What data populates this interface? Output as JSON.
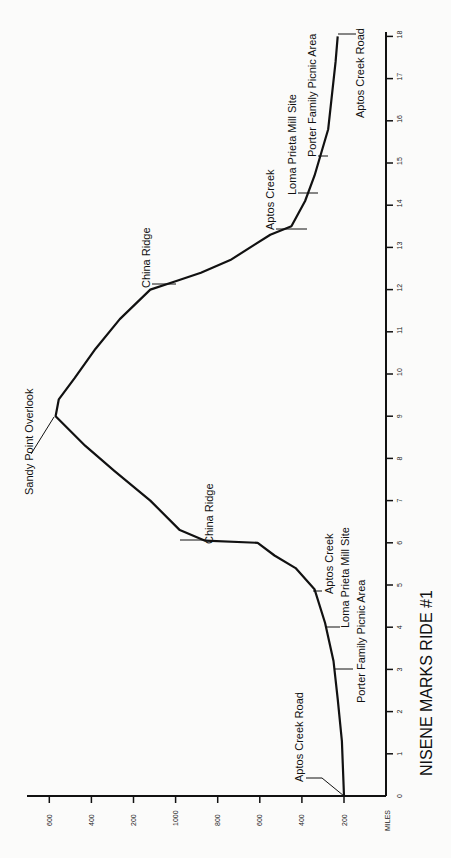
{
  "chart_data": {
    "type": "line",
    "title": "NISENE MARKS RIDE #1",
    "xlabel": "MILES",
    "ylabel": "",
    "orientation": "rotated-90",
    "xlim": [
      0,
      18
    ],
    "ylim": [
      200,
      1600
    ],
    "grid": false,
    "x_ticks": [
      "0",
      "1",
      "2",
      "3",
      "4",
      "5",
      "6",
      "7",
      "8",
      "9",
      "10",
      "11",
      "12",
      "13",
      "14",
      "15",
      "16",
      "17",
      "18"
    ],
    "y_ticks": [
      {
        "value": 1600,
        "label": "600"
      },
      {
        "value": 1400,
        "label": "400"
      },
      {
        "value": 1200,
        "label": "200"
      },
      {
        "value": 1000,
        "label": "1000"
      },
      {
        "value": 800,
        "label": "800"
      },
      {
        "value": 600,
        "label": "600"
      },
      {
        "value": 400,
        "label": "400"
      },
      {
        "value": 200,
        "label": "200"
      }
    ],
    "series": [
      {
        "name": "Elevation (ft)",
        "x": [
          0,
          1.3,
          2.3,
          3.2,
          4.1,
          4.9,
          5.4,
          5.7,
          6.0,
          6.05,
          6.3,
          7.0,
          7.7,
          8.3,
          9.0,
          9.4,
          9.9,
          10.6,
          11.3,
          12.0,
          12.2,
          12.4,
          12.7,
          13.3,
          13.5,
          14.1,
          14.7,
          15.8,
          17.4,
          18.0
        ],
        "values": [
          200,
          210,
          230,
          250,
          290,
          340,
          430,
          530,
          610,
          860,
          980,
          1120,
          1290,
          1430,
          1570,
          1555,
          1480,
          1380,
          1265,
          1120,
          1000,
          880,
          740,
          550,
          450,
          385,
          340,
          275,
          240,
          230
        ]
      }
    ],
    "annotations": [
      {
        "label": "Aptos Creek Road",
        "mile": 0,
        "elev": 200
      },
      {
        "label": "Porter Family Picnic Area",
        "mile": 3.0,
        "elev": 245
      },
      {
        "label": "Loma Prieta Mill Site",
        "mile": 4.0,
        "elev": 285
      },
      {
        "label": "Aptos Creek",
        "mile": 4.8,
        "elev": 335
      },
      {
        "label": "China Ridge",
        "mile": 6.0,
        "elev": 860
      },
      {
        "label": "Sandy Point Overlook",
        "mile": 9.0,
        "elev": 1570
      },
      {
        "label": "China Ridge",
        "mile": 12.2,
        "elev": 1000
      },
      {
        "label": "Aptos Creek",
        "mile": 13.5,
        "elev": 450
      },
      {
        "label": "Loma Prieta Mill Site",
        "mile": 14.5,
        "elev": 350
      },
      {
        "label": "Porter Family Picnic Area",
        "mile": 15.2,
        "elev": 310
      },
      {
        "label": "Aptos Creek Road",
        "mile": 18.0,
        "elev": 230
      }
    ]
  },
  "labels": {
    "title": "NISENE MARKS RIDE #1",
    "miles_axis": "MILES",
    "aptos_creek_road_start": "Aptos Creek Road",
    "porter_picnic_1": "Porter Family Picnic Area",
    "loma_prieta_1": "Loma Prieta Mill Site",
    "aptos_creek_1": "Aptos Creek",
    "china_ridge_1": "China Ridge",
    "sandy_point": "Sandy Point Overlook",
    "china_ridge_2": "China Ridge",
    "aptos_creek_2": "Aptos Creek",
    "loma_prieta_2": "Loma Prieta Mill Site",
    "porter_picnic_2": "Porter Family Picnic Area",
    "aptos_creek_road_end": "Aptos Creek Road"
  },
  "colors": {
    "line": "#111111",
    "background": "#fbfbfa"
  }
}
